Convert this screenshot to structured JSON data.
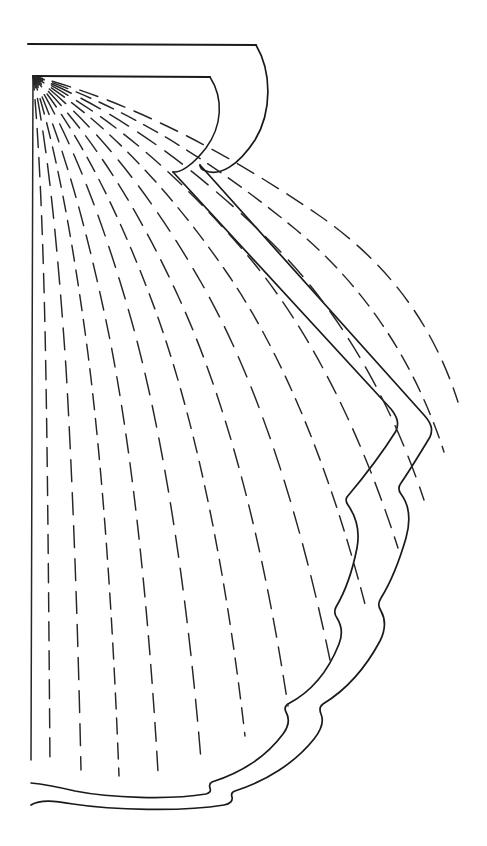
{
  "figure": {
    "kind": "line-art-illustration",
    "title": "",
    "caption": "",
    "canvas": {
      "width": 487,
      "height": 846,
      "background": "#ffffff"
    },
    "ink_color": "#1a1a1a",
    "ray_color": "#262626",
    "style": "uncolored contour line drawing, dashed radial ribs"
  },
  "chart_data": {
    "type": "line",
    "title": "",
    "xlabel": "",
    "ylabel": "",
    "grid": false,
    "legend": "none",
    "xlim": [
      0,
      487
    ],
    "ylim": [
      0,
      846
    ]
  },
  "geometry": {
    "umbo": {
      "x": 33,
      "y": 76
    },
    "hinge_top": {
      "start_x": 28,
      "start_y": 44,
      "end_x": 256,
      "end_y": 45
    },
    "hinge_inner": {
      "start_x": 33,
      "start_y": 76,
      "end_x": 210,
      "end_y": 77
    },
    "outer_extent_x": 446,
    "outer_extent_y": 806,
    "ray_count": 14,
    "scallop_count": 6
  },
  "paths": {
    "hinge_top_line": "M28,44 L256,45",
    "hinge_inner_line": "M33,76 L210,77",
    "auricle_outer": "M256,45 C272,72 272,112 255,140 C238,166 220,176 206,171 C202,170 200,168 200,165",
    "auricle_inner": "M210,77 C224,99 222,126 206,148 C192,166 180,173 173,172",
    "margin_inner": "M173,172 L391,409 C398,418 399,424 396,431 C381,455 363,478 347,497 C345,500 346,502 348,505 C357,518 360,532 357,548 C352,573 345,592 336,607 C334,611 334,614 337,618 C342,626 343,634 339,644 C328,672 311,692 288,704 C285,706 284,708 286,712 C290,719 289,726 283,734 C266,757 240,773 212,782 C210,783 209,785 210,788 C211,791 210,793 206,794 C170,800 110,798 75,791 C58,787 42,784 31,783",
    "margin_outer": "M200,165 L424,415 C432,424 433,430 430,437 C419,455 410,470 401,483 C398,487 398,490 401,494 C410,506 411,520 406,538 C399,562 391,582 381,598 C378,603 378,606 381,611 C386,620 386,629 380,641 C365,669 346,690 323,704 C320,706 319,709 321,714 C324,721 322,729 314,739 C295,763 266,781 235,791 C232,792 231,794 232,797 C233,801 230,804 224,805 C182,812 112,810 73,804 C55,801 41,799 31,805"
  },
  "rays": [
    {
      "id": "ray-1",
      "dash": "solid",
      "d": "M33,76 C33,160 32,300 32,430 C32,560 32,680 31,760"
    },
    {
      "id": "ray-2",
      "dash": "dashed",
      "d": "M33,76 C40,150 44,260 46,380 C48,500 49,640 50,764"
    },
    {
      "id": "ray-3",
      "dash": "dashed",
      "d": "M33,76 C48,146 58,250 66,368 C73,488 78,630 81,770"
    },
    {
      "id": "ray-4",
      "dash": "dashed",
      "d": "M33,76 C55,142 73,240 88,354 C103,472 113,620 119,776"
    },
    {
      "id": "ray-5",
      "dash": "dashed",
      "d": "M33,76 C62,138 88,232 110,340 C132,452 148,600 158,772"
    },
    {
      "id": "ray-6",
      "dash": "dashed",
      "d": "M33,76 C70,134 104,222 133,326 C162,432 186,578 201,760"
    },
    {
      "id": "ray-7",
      "dash": "dashed",
      "d": "M33,76 C78,130 120,214 156,312 C192,412 224,552 245,736"
    },
    {
      "id": "ray-8",
      "dash": "dashed",
      "d": "M33,76 C86,126 136,204 179,298 C222,392 260,522 288,706"
    },
    {
      "id": "ray-9",
      "dash": "dashed",
      "d": "M33,76 C94,122 152,196 202,284 C252,372 296,496 330,660"
    },
    {
      "id": "ray-10",
      "dash": "dashed",
      "d": "M33,76 C102,118 168,188 225,270 C282,352 330,468 366,608"
    },
    {
      "id": "ray-11",
      "dash": "dashed",
      "d": "M33,76 C110,114 184,180 248,256 C312,332 362,436 398,548"
    },
    {
      "id": "ray-12",
      "dash": "dashed",
      "d": "M33,76 C118,110 200,172 271,242 C342,312 392,404 424,500"
    },
    {
      "id": "ray-13",
      "dash": "dashed",
      "d": "M33,76 C126,106 216,164 294,228 C372,292 418,372 444,452"
    },
    {
      "id": "ray-14",
      "dash": "dashed",
      "d": "M33,76 C134,102 232,156 317,214 C396,268 436,334 458,402"
    }
  ],
  "ray_dash_patterns": {
    "fine": "16 9",
    "medium": "19 10",
    "coarse": "22 11"
  }
}
